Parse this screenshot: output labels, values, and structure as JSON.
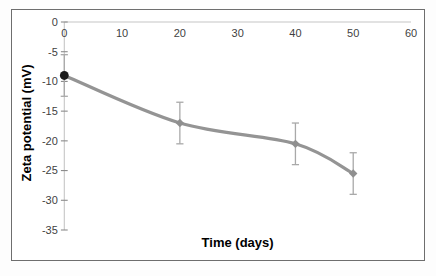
{
  "figure": {
    "background": "#ffffff",
    "border_color": "#6e6e6e"
  },
  "chart_data": {
    "type": "line",
    "title": "",
    "xlabel": "Time (days)",
    "ylabel": "Zeta potential (mV)",
    "x": [
      0,
      20,
      40,
      50
    ],
    "y": [
      -9,
      -17,
      -20.5,
      -25.5
    ],
    "yerr": [
      3.5,
      3.5,
      3.5,
      3.5
    ],
    "xlim": [
      0,
      60
    ],
    "ylim": [
      -35,
      0
    ],
    "x_ticks": [
      0,
      10,
      20,
      30,
      40,
      50,
      60
    ],
    "y_ticks": [
      0,
      -5,
      -10,
      -15,
      -20,
      -25,
      -30,
      -35
    ],
    "grid": false,
    "legend": false,
    "smoothed_line": true,
    "line_color": "#949494",
    "marker_shapes": [
      "circle",
      "diamond",
      "diamond",
      "diamond"
    ],
    "marker_colors": [
      "#1c1c1c",
      "#8f8f8f",
      "#8f8f8f",
      "#8f8f8f"
    ],
    "error_bar_color": "#a9a9a9",
    "axis_line_color": "#c6c6c6",
    "tick_mark_color": "#8c8c8c",
    "tick_label_color": "#3f3f3f",
    "axis_title_color": "#1f1f1f"
  }
}
